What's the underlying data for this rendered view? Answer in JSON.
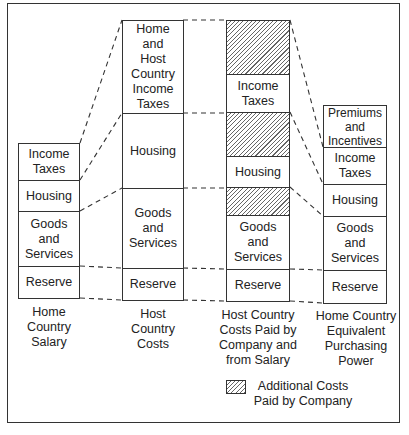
{
  "diagram": {
    "columns": [
      {
        "caption": "Home\nCountry\nSalary",
        "segments": [
          {
            "label": "Income\nTaxes",
            "hatched": false
          },
          {
            "label": "Housing",
            "hatched": false
          },
          {
            "label": "Goods\nand\nServices",
            "hatched": false
          },
          {
            "label": "Reserve",
            "hatched": false
          }
        ]
      },
      {
        "caption": "Host\nCountry\nCosts",
        "segments": [
          {
            "label": "Home\nand\nHost\nCountry\nIncome\nTaxes",
            "hatched": false
          },
          {
            "label": "Housing",
            "hatched": false
          },
          {
            "label": "Goods\nand\nServices",
            "hatched": false
          },
          {
            "label": "Reserve",
            "hatched": false
          }
        ]
      },
      {
        "caption": "Host Country\nCosts Paid by\nCompany and\nfrom Salary",
        "segments": [
          {
            "label": "",
            "hatched": true
          },
          {
            "label": "Income\nTaxes",
            "hatched": false
          },
          {
            "label": "",
            "hatched": true
          },
          {
            "label": "Housing",
            "hatched": false
          },
          {
            "label": "",
            "hatched": true
          },
          {
            "label": "Goods\nand\nServices",
            "hatched": false
          },
          {
            "label": "Reserve",
            "hatched": false
          }
        ]
      },
      {
        "caption": "Home Country\nEquivalent\nPurchasing\nPower",
        "segments": [
          {
            "label": "Premiums\nand\nIncentives",
            "hatched": false
          },
          {
            "label": "Income\nTaxes",
            "hatched": false
          },
          {
            "label": "Housing",
            "hatched": false
          },
          {
            "label": "Goods\nand\nServices",
            "hatched": false
          },
          {
            "label": "Reserve",
            "hatched": false
          }
        ]
      }
    ],
    "legend": {
      "label": "Additional Costs\nPaid by Company",
      "swatch": "hatched"
    },
    "colors": {
      "line": "#333333",
      "hatch": "#666666",
      "background": "#ffffff"
    }
  }
}
